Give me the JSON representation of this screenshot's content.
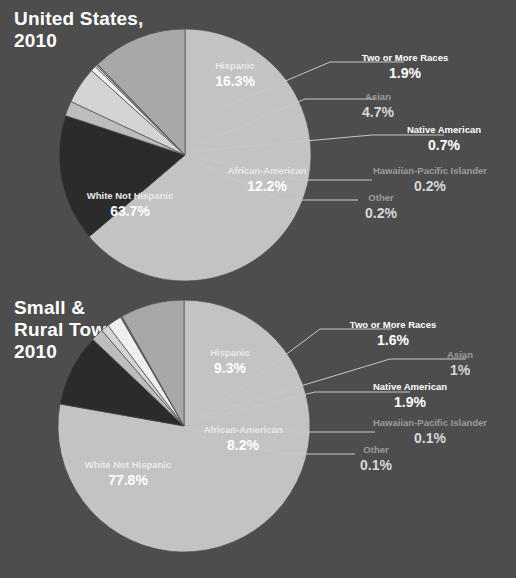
{
  "background_color": "#4d4d4d",
  "palette": {
    "white_not_hispanic": "#c3c3c3",
    "hispanic": "#2b2b2b",
    "african_american": "#a8a8a8",
    "two_or_more_races": "#bdbdbd",
    "asian": "#d4d4d4",
    "native_american": "#efefef",
    "hawaiian_pacific_islander": "#f7f7f7",
    "other": "#9a9a9a",
    "leader_line": "#c8c8c8",
    "text_white": "#ffffff",
    "text_dim": "#9c9c9c"
  },
  "chart_data": [
    {
      "type": "pie",
      "title": "United States,\n2010",
      "xlabel": "",
      "ylabel": "",
      "legend_position": "callout-labels",
      "categories": [
        "White Not Hispanic",
        "Hispanic",
        "Two or More Races",
        "Asian",
        "Native American",
        "Hawaiian-Pacific Islander",
        "Other",
        "African-American"
      ],
      "values": [
        63.7,
        16.3,
        1.9,
        4.7,
        0.7,
        0.2,
        0.2,
        12.2
      ],
      "value_labels": [
        "63.7%",
        "16.3%",
        "1.9%",
        "4.7%",
        "0.7%",
        "0.2%",
        "0.2%",
        "12.2%"
      ],
      "slices": [
        {
          "label": "White Not Hispanic",
          "value": 63.7,
          "value_label": "63.7%",
          "color": "#c3c3c3",
          "label_style": "on-slice"
        },
        {
          "label": "Hispanic",
          "value": 16.3,
          "value_label": "16.3%",
          "color": "#2b2b2b",
          "label_style": "on-slice"
        },
        {
          "label": "Two or More Races",
          "value": 1.9,
          "value_label": "1.9%",
          "color": "#bdbdbd",
          "label_style": "callout-bright"
        },
        {
          "label": "Asian",
          "value": 4.7,
          "value_label": "4.7%",
          "color": "#d4d4d4",
          "label_style": "callout-dim"
        },
        {
          "label": "Native American",
          "value": 0.7,
          "value_label": "0.7%",
          "color": "#efefef",
          "label_style": "callout-bright"
        },
        {
          "label": "Hawaiian-Pacific Islander",
          "value": 0.2,
          "value_label": "0.2%",
          "color": "#f7f7f7",
          "label_style": "callout-dim"
        },
        {
          "label": "Other",
          "value": 0.2,
          "value_label": "0.2%",
          "color": "#9a9a9a",
          "label_style": "callout-dim"
        },
        {
          "label": "African-American",
          "value": 12.2,
          "value_label": "12.2%",
          "color": "#a8a8a8",
          "label_style": "on-slice"
        }
      ]
    },
    {
      "type": "pie",
      "title": "Small &\nRural Town,\n2010",
      "xlabel": "",
      "ylabel": "",
      "legend_position": "callout-labels",
      "categories": [
        "White Not Hispanic",
        "Hispanic",
        "Two or More Races",
        "Asian",
        "Native American",
        "Hawaiian-Pacific Islander",
        "Other",
        "African-American"
      ],
      "values": [
        77.8,
        9.3,
        1.6,
        1.0,
        1.9,
        0.1,
        0.1,
        8.2
      ],
      "value_labels": [
        "77.8%",
        "9.3%",
        "1.6%",
        "1%",
        "1.9%",
        "0.1%",
        "0.1%",
        "8.2%"
      ],
      "slices": [
        {
          "label": "White Not Hispanic",
          "value": 77.8,
          "value_label": "77.8%",
          "color": "#c3c3c3",
          "label_style": "on-slice"
        },
        {
          "label": "Hispanic",
          "value": 9.3,
          "value_label": "9.3%",
          "color": "#2b2b2b",
          "label_style": "on-slice"
        },
        {
          "label": "Two or More Races",
          "value": 1.6,
          "value_label": "1.6%",
          "color": "#bdbdbd",
          "label_style": "callout-bright"
        },
        {
          "label": "Asian",
          "value": 1.0,
          "value_label": "1%",
          "color": "#d4d4d4",
          "label_style": "callout-dim"
        },
        {
          "label": "Native American",
          "value": 1.9,
          "value_label": "1.9%",
          "color": "#efefef",
          "label_style": "callout-bright"
        },
        {
          "label": "Hawaiian-Pacific Islander",
          "value": 0.1,
          "value_label": "0.1%",
          "color": "#f7f7f7",
          "label_style": "callout-dim"
        },
        {
          "label": "Other",
          "value": 0.1,
          "value_label": "0.1%",
          "color": "#9a9a9a",
          "label_style": "callout-dim"
        },
        {
          "label": "African-American",
          "value": 8.2,
          "value_label": "8.2%",
          "color": "#a8a8a8",
          "label_style": "on-slice"
        }
      ]
    }
  ],
  "us_chart": {
    "title": "United States,\n2010",
    "labels": {
      "white": {
        "name": "White Not Hispanic",
        "value": "63.7%"
      },
      "hispanic": {
        "name": "Hispanic",
        "value": "16.3%"
      },
      "african_american": {
        "name": "African-American",
        "value": "12.2%"
      },
      "two_or_more": {
        "name": "Two or More Races",
        "value": "1.9%"
      },
      "asian": {
        "name": "Asian",
        "value": "4.7%"
      },
      "native_american": {
        "name": "Native American",
        "value": "0.7%"
      },
      "hawaiian": {
        "name": "Hawaiian-Pacific Islander",
        "value": "0.2%"
      },
      "other": {
        "name": "Other",
        "value": "0.2%"
      }
    }
  },
  "rural_chart": {
    "title": "Small &\nRural Town,\n2010",
    "labels": {
      "white": {
        "name": "White Not Hispanic",
        "value": "77.8%"
      },
      "hispanic": {
        "name": "Hispanic",
        "value": "9.3%"
      },
      "african_american": {
        "name": "African-American",
        "value": "8.2%"
      },
      "two_or_more": {
        "name": "Two or More Races",
        "value": "1.6%"
      },
      "asian": {
        "name": "Asian",
        "value": "1%"
      },
      "native_american": {
        "name": "Native American",
        "value": "1.9%"
      },
      "hawaiian": {
        "name": "Hawaiian-Pacific Islander",
        "value": "0.1%"
      },
      "other": {
        "name": "Other",
        "value": "0.1%"
      }
    }
  }
}
